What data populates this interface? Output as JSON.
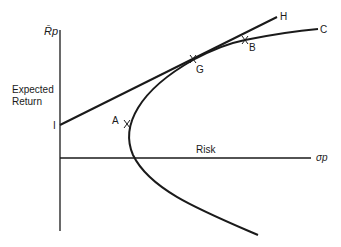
{
  "diagram": {
    "y_axis_label": "R̄p",
    "y_axis_title_line1": "Expected",
    "y_axis_title_line2": "Return",
    "x_axis_title": "Risk",
    "x_axis_label": "σp",
    "points": {
      "I": "I",
      "A": "A",
      "G": "G",
      "B": "B",
      "C": "C",
      "H": "H"
    },
    "colors": {
      "line": "#1a1a1a",
      "background": "#ffffff"
    }
  }
}
